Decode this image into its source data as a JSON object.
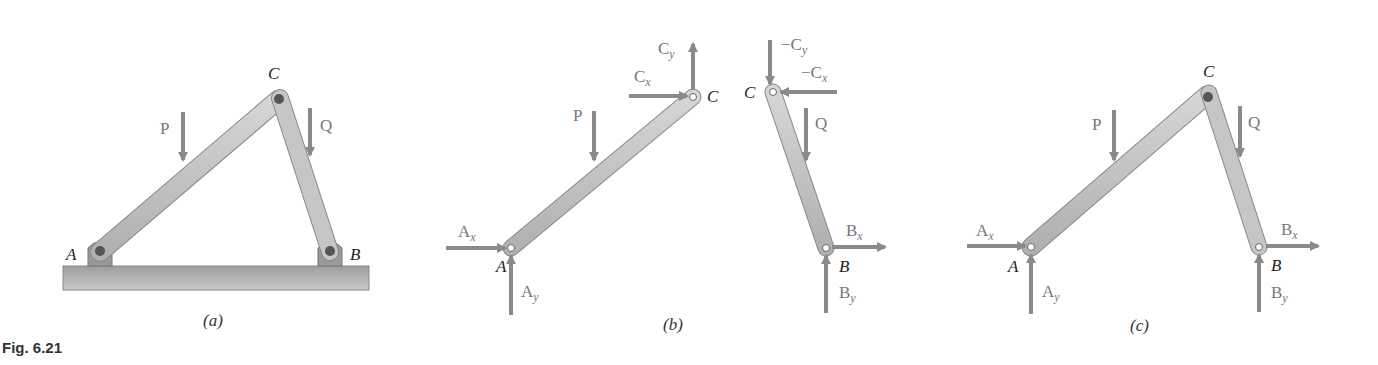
{
  "figure": {
    "label": "Fig. 6.21",
    "panels": [
      {
        "id": "a",
        "caption": "(a)",
        "points": {
          "A": "A",
          "B": "B",
          "C": "C"
        },
        "loads": {
          "P": "P",
          "Q": "Q"
        }
      },
      {
        "id": "b",
        "caption": "(b)",
        "points": {
          "A": "A",
          "B": "B",
          "C_left": "C",
          "C_right": "C"
        },
        "loads": {
          "P": "P",
          "Q": "Q"
        },
        "forces": {
          "Ax": "A",
          "Ax_sub": "x",
          "Ay": "A",
          "Ay_sub": "y",
          "Cx": "C",
          "Cx_sub": "x",
          "Cy": "C",
          "Cy_sub": "y",
          "negCx": "−C",
          "negCx_sub": "x",
          "negCy": "−C",
          "negCy_sub": "y",
          "Bx": "B",
          "Bx_sub": "x",
          "By": "B",
          "By_sub": "y"
        }
      },
      {
        "id": "c",
        "caption": "(c)",
        "points": {
          "A": "A",
          "B": "B",
          "C": "C"
        },
        "loads": {
          "P": "P",
          "Q": "Q"
        },
        "forces": {
          "Ax": "A",
          "Ax_sub": "x",
          "Ay": "A",
          "Ay_sub": "y",
          "Bx": "B",
          "Bx_sub": "x",
          "By": "B",
          "By_sub": "y"
        }
      }
    ],
    "colors": {
      "arrow": "#8a8a8a",
      "member": "#c4c4c4",
      "ground": "#a8a8a8"
    }
  }
}
